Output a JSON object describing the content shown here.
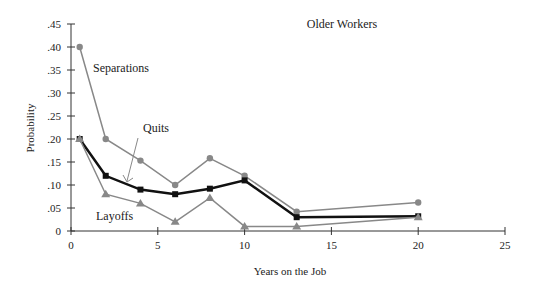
{
  "chart_data": {
    "type": "line",
    "title": "Older Workers",
    "xlabel": "Years on the Job",
    "ylabel": "Probability",
    "xlim": [
      0,
      25
    ],
    "ylim": [
      0,
      0.45
    ],
    "xticks": [
      "0",
      "5",
      "10",
      "15",
      "20",
      "25"
    ],
    "yticks": [
      "0",
      ".05",
      ".10",
      ".15",
      ".20",
      ".25",
      ".30",
      ".35",
      ".40",
      ".45"
    ],
    "x": [
      0.5,
      2,
      4,
      6,
      8,
      10,
      13,
      20
    ],
    "series": [
      {
        "name": "Separations",
        "marker": "circle",
        "color": "#888888",
        "values": [
          0.4,
          0.2,
          0.153,
          0.1,
          0.158,
          0.12,
          0.042,
          0.062
        ]
      },
      {
        "name": "Quits",
        "marker": "square",
        "color": "#111111",
        "values": [
          0.2,
          0.12,
          0.09,
          0.08,
          0.092,
          0.11,
          0.03,
          0.032
        ]
      },
      {
        "name": "Layoffs",
        "marker": "triangle",
        "color": "#888888",
        "values": [
          0.2,
          0.08,
          0.06,
          0.02,
          0.072,
          0.01,
          0.01,
          0.03
        ]
      }
    ],
    "annotations": [
      {
        "text": "Separations",
        "x": 93,
        "y": 72
      },
      {
        "text": "Quits",
        "x": 143,
        "y": 132
      },
      {
        "text": "Layoffs",
        "x": 96,
        "y": 220
      }
    ],
    "grid": false,
    "legend": "inline labels"
  }
}
